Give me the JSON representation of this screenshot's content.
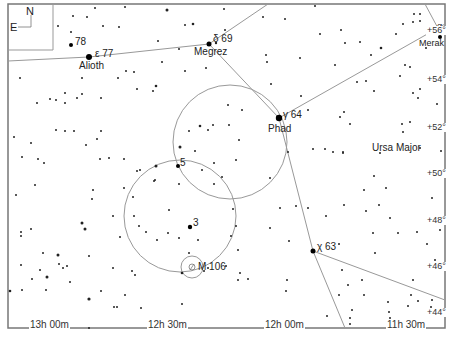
{
  "map": {
    "constellation": "Ursa Major",
    "compass": {
      "north": "N",
      "east": "E"
    },
    "ra_labels": [
      {
        "text": "13h 00m",
        "x": 32
      },
      {
        "text": "12h 30m",
        "x": 148
      },
      {
        "text": "12h 00m",
        "x": 264
      },
      {
        "text": "11h 30m",
        "x": 385
      }
    ],
    "dec_labels": [
      {
        "text": "+56°",
        "y": 32
      },
      {
        "text": "+54°",
        "y": 80
      },
      {
        "text": "+52°",
        "y": 128
      },
      {
        "text": "+50°",
        "y": 174
      },
      {
        "text": "+48°",
        "y": 221
      },
      {
        "text": "+46°",
        "y": 267
      },
      {
        "text": "+44°",
        "y": 313
      }
    ],
    "named_stars": [
      {
        "designation": "ε 77",
        "name": "Alioth",
        "x": 88,
        "y": 57
      },
      {
        "designation": "78",
        "name": "",
        "x": 70,
        "y": 45
      },
      {
        "designation": "δ 69",
        "name": "Megrez",
        "x": 209,
        "y": 43
      },
      {
        "designation": "γ 64",
        "name": "Phad",
        "x": 279,
        "y": 118
      },
      {
        "designation": "α",
        "name": "Merak",
        "x": 446,
        "y": 38
      },
      {
        "designation": "χ 63",
        "name": "",
        "x": 313,
        "y": 251
      },
      {
        "designation": "5",
        "name": "",
        "x": 178,
        "y": 166
      },
      {
        "designation": "3",
        "name": "",
        "x": 190,
        "y": 227
      }
    ],
    "deep_sky": [
      {
        "label": "M 106",
        "x": 191,
        "y": 266
      }
    ]
  }
}
